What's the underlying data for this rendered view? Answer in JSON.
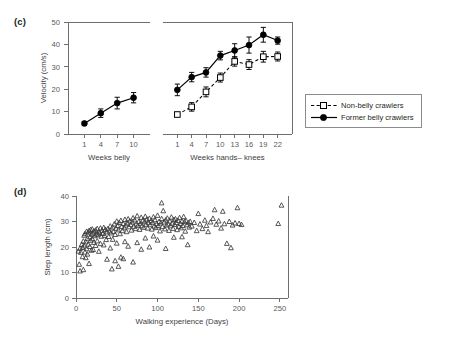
{
  "figure": {
    "panels": [
      {
        "id": "c",
        "label": "(c)"
      },
      {
        "id": "d",
        "label": "(d)"
      }
    ]
  },
  "legend": {
    "position": "right-middle",
    "entries": [
      {
        "label": "Non-belly crawlers",
        "marker": "open-square",
        "line": "dashed",
        "color": "#000000"
      },
      {
        "label": "Former belly crawlers",
        "marker": "filled-circle",
        "line": "solid",
        "color": "#000000"
      }
    ]
  },
  "chart_data": [
    {
      "id": "panel-c",
      "type": "line",
      "title": "",
      "ylabel": "Velocity (cm/s)",
      "ylim": [
        0,
        50
      ],
      "yticks": [
        0,
        10,
        20,
        30,
        40,
        50
      ],
      "grid": false,
      "legend_position": "right",
      "subpanels": [
        {
          "name": "belly",
          "xlabel": "Weeks belly",
          "categories": [
            "1",
            "4",
            "7",
            "10"
          ],
          "series": [
            {
              "name": "Former belly crawlers",
              "marker": "filled-circle",
              "line": "solid",
              "values": [
                4.7,
                9.3,
                13.8,
                16.2
              ],
              "errors": [
                0.9,
                1.9,
                2.6,
                2.3
              ]
            }
          ]
        },
        {
          "name": "hands-knees",
          "xlabel": "Weeks hands– knees",
          "categories": [
            "1",
            "4",
            "7",
            "10",
            "13",
            "16",
            "19",
            "22"
          ],
          "series": [
            {
              "name": "Former belly crawlers",
              "marker": "filled-circle",
              "line": "solid",
              "values": [
                19.7,
                25.4,
                27.5,
                35.0,
                37.3,
                39.7,
                44.3,
                41.7
              ],
              "errors": [
                2.6,
                2.1,
                2.1,
                1.9,
                3.0,
                3.6,
                3.3,
                1.6
              ]
            },
            {
              "name": "Non-belly crawlers",
              "marker": "open-square",
              "line": "dashed",
              "values": [
                8.7,
                12.1,
                18.8,
                25.2,
                32.4,
                31.0,
                34.5,
                34.6
              ],
              "errors": [
                0.8,
                1.9,
                2.2,
                2.0,
                2.1,
                2.2,
                2.4,
                2.0
              ]
            }
          ]
        }
      ]
    },
    {
      "id": "panel-d",
      "type": "scatter",
      "title": "",
      "xlabel": "Walking experience (Days)",
      "ylabel": "Step length (cm)",
      "xlim": [
        0,
        260
      ],
      "ylim": [
        0,
        40
      ],
      "xticks": [
        0,
        50,
        100,
        150,
        200,
        250
      ],
      "yticks": [
        0,
        10,
        20,
        30,
        40
      ],
      "grid": false,
      "marker": "open-triangle",
      "points": [
        [
          3,
          18.4
        ],
        [
          4,
          13.2
        ],
        [
          5,
          10.6
        ],
        [
          5,
          19.5
        ],
        [
          6,
          17.9
        ],
        [
          7,
          21.0
        ],
        [
          8,
          19.8
        ],
        [
          8,
          16.2
        ],
        [
          9,
          22.3
        ],
        [
          9,
          11.1
        ],
        [
          10,
          20.4
        ],
        [
          10,
          24.6
        ],
        [
          11,
          18.0
        ],
        [
          11,
          25.2
        ],
        [
          12,
          22.0
        ],
        [
          12,
          15.8
        ],
        [
          13,
          26.1
        ],
        [
          13,
          19.3
        ],
        [
          14,
          23.4
        ],
        [
          14,
          17.2
        ],
        [
          15,
          25.8
        ],
        [
          15,
          21.1
        ],
        [
          16,
          26.4
        ],
        [
          16,
          13.5
        ],
        [
          17,
          24.0
        ],
        [
          17,
          20.2
        ],
        [
          18,
          26.8
        ],
        [
          18,
          22.6
        ],
        [
          19,
          25.0
        ],
        [
          19,
          18.7
        ],
        [
          20,
          27.0
        ],
        [
          20,
          23.2
        ],
        [
          21,
          25.4
        ],
        [
          21,
          19.0
        ],
        [
          22,
          26.2
        ],
        [
          22,
          21.8
        ],
        [
          23,
          24.4
        ],
        [
          24,
          26.6
        ],
        [
          24,
          20.6
        ],
        [
          25,
          25.1
        ],
        [
          26,
          27.2
        ],
        [
          26,
          22.4
        ],
        [
          27,
          24.8
        ],
        [
          28,
          26.0
        ],
        [
          28,
          18.3
        ],
        [
          29,
          25.6
        ],
        [
          30,
          27.4
        ],
        [
          30,
          21.3
        ],
        [
          31,
          24.2
        ],
        [
          32,
          26.5
        ],
        [
          33,
          25.3
        ],
        [
          34,
          27.6
        ],
        [
          34,
          20.8
        ],
        [
          35,
          24.6
        ],
        [
          36,
          26.9
        ],
        [
          37,
          22.9
        ],
        [
          38,
          25.9
        ],
        [
          38,
          15.2
        ],
        [
          39,
          27.1
        ],
        [
          40,
          24.1
        ],
        [
          41,
          26.3
        ],
        [
          42,
          28.2
        ],
        [
          42,
          19.6
        ],
        [
          43,
          25.5
        ],
        [
          44,
          11.4
        ],
        [
          45,
          27.8
        ],
        [
          45,
          23.0
        ],
        [
          46,
          26.1
        ],
        [
          47,
          29.0
        ],
        [
          48,
          24.9
        ],
        [
          48,
          14.6
        ],
        [
          49,
          27.3
        ],
        [
          50,
          30.1
        ],
        [
          50,
          21.5
        ],
        [
          51,
          28.4
        ],
        [
          52,
          26.7
        ],
        [
          52,
          12.4
        ],
        [
          53,
          29.6
        ],
        [
          54,
          25.2
        ],
        [
          55,
          30.4
        ],
        [
          55,
          16.0
        ],
        [
          56,
          28.0
        ],
        [
          57,
          26.4
        ],
        [
          58,
          29.2
        ],
        [
          58,
          15.4
        ],
        [
          59,
          27.5
        ],
        [
          60,
          30.8
        ],
        [
          60,
          22.1
        ],
        [
          61,
          28.6
        ],
        [
          62,
          26.0
        ],
        [
          63,
          29.4
        ],
        [
          64,
          31.0
        ],
        [
          64,
          20.3
        ],
        [
          65,
          27.9
        ],
        [
          66,
          30.2
        ],
        [
          67,
          28.8
        ],
        [
          68,
          26.6
        ],
        [
          69,
          29.8
        ],
        [
          70,
          31.4
        ],
        [
          70,
          14.1
        ],
        [
          71,
          28.1
        ],
        [
          72,
          30.6
        ],
        [
          73,
          27.2
        ],
        [
          74,
          29.0
        ],
        [
          75,
          32.2
        ],
        [
          75,
          21.7
        ],
        [
          76,
          28.5
        ],
        [
          77,
          30.0
        ],
        [
          78,
          26.9
        ],
        [
          79,
          29.3
        ],
        [
          80,
          31.6
        ],
        [
          80,
          19.1
        ],
        [
          81,
          28.3
        ],
        [
          82,
          30.5
        ],
        [
          83,
          27.7
        ],
        [
          84,
          29.9
        ],
        [
          85,
          32.0
        ],
        [
          85,
          23.5
        ],
        [
          86,
          28.9
        ],
        [
          87,
          30.9
        ],
        [
          88,
          27.4
        ],
        [
          89,
          29.5
        ],
        [
          90,
          31.2
        ],
        [
          90,
          20.0
        ],
        [
          91,
          28.7
        ],
        [
          92,
          30.3
        ],
        [
          93,
          27.0
        ],
        [
          94,
          29.7
        ],
        [
          95,
          31.8
        ],
        [
          95,
          24.3
        ],
        [
          96,
          28.2
        ],
        [
          97,
          30.7
        ],
        [
          98,
          27.6
        ],
        [
          99,
          29.1
        ],
        [
          100,
          32.4
        ],
        [
          100,
          22.7
        ],
        [
          101,
          28.4
        ],
        [
          102,
          30.0
        ],
        [
          103,
          26.3
        ],
        [
          104,
          29.4
        ],
        [
          105,
          37.3
        ],
        [
          105,
          31.1
        ],
        [
          106,
          28.0
        ],
        [
          107,
          34.2
        ],
        [
          108,
          29.8
        ],
        [
          109,
          27.1
        ],
        [
          110,
          30.6
        ],
        [
          110,
          19.4
        ],
        [
          111,
          28.6
        ],
        [
          112,
          31.3
        ],
        [
          113,
          29.0
        ],
        [
          114,
          26.5
        ],
        [
          115,
          30.2
        ],
        [
          116,
          28.3
        ],
        [
          117,
          31.7
        ],
        [
          118,
          29.3
        ],
        [
          119,
          27.3
        ],
        [
          120,
          30.8
        ],
        [
          120,
          23.8
        ],
        [
          121,
          28.8
        ],
        [
          122,
          31.0
        ],
        [
          123,
          29.6
        ],
        [
          124,
          26.8
        ],
        [
          125,
          30.4
        ],
        [
          126,
          28.1
        ],
        [
          127,
          31.5
        ],
        [
          128,
          29.2
        ],
        [
          129,
          27.5
        ],
        [
          130,
          30.1
        ],
        [
          130,
          24.0
        ],
        [
          131,
          28.4
        ],
        [
          132,
          31.9
        ],
        [
          133,
          29.9
        ],
        [
          134,
          26.2
        ],
        [
          135,
          30.3
        ],
        [
          136,
          28.7
        ],
        [
          137,
          20.9
        ],
        [
          138,
          29.5
        ],
        [
          139,
          27.8
        ],
        [
          140,
          30.0
        ],
        [
          142,
          28.2
        ],
        [
          145,
          29.6
        ],
        [
          148,
          26.4
        ],
        [
          150,
          33.1
        ],
        [
          152,
          29.0
        ],
        [
          155,
          27.2
        ],
        [
          158,
          30.5
        ],
        [
          160,
          28.4
        ],
        [
          162,
          26.0
        ],
        [
          165,
          29.8
        ],
        [
          168,
          31.2
        ],
        [
          170,
          34.6
        ],
        [
          172,
          28.9
        ],
        [
          175,
          30.2
        ],
        [
          178,
          27.4
        ],
        [
          180,
          34.0
        ],
        [
          182,
          29.1
        ],
        [
          185,
          21.4
        ],
        [
          188,
          30.0
        ],
        [
          190,
          19.7
        ],
        [
          192,
          28.6
        ],
        [
          195,
          29.4
        ],
        [
          198,
          35.4
        ],
        [
          200,
          29.2
        ],
        [
          203,
          28.8
        ],
        [
          248,
          29.2
        ],
        [
          252,
          36.4
        ]
      ]
    }
  ]
}
